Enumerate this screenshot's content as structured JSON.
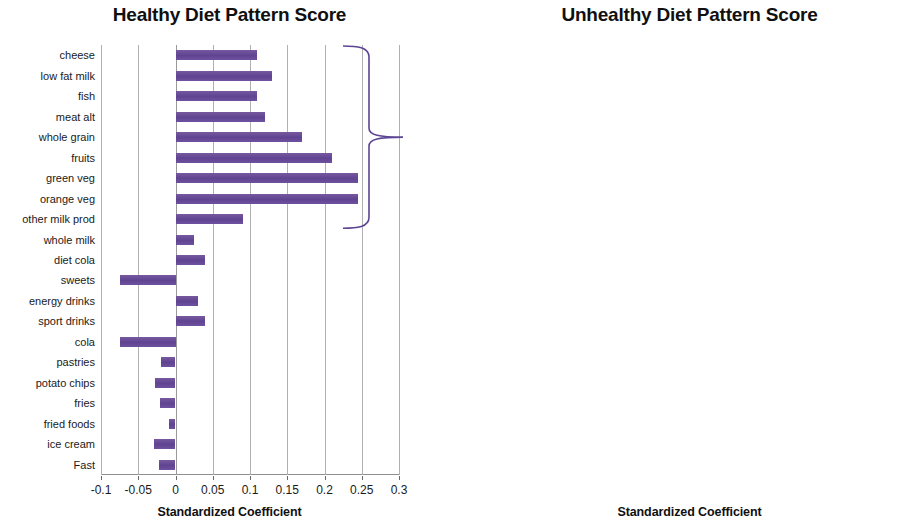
{
  "chart_data": [
    {
      "type": "bar",
      "orientation": "horizontal",
      "title": "Healthy Diet Pattern Score",
      "xlabel": "Standardized Coefficient",
      "ylabel": "",
      "xlim": [
        -0.1,
        0.3
      ],
      "xticks": [
        "-0.1",
        "-0.05",
        "0",
        "0.05",
        "0.1",
        "0.15",
        "0.2",
        "0.25",
        "0.3"
      ],
      "xtick_values": [
        -0.1,
        -0.05,
        0,
        0.05,
        0.1,
        0.15,
        0.2,
        0.25,
        0.3
      ],
      "grid": true,
      "legend": "none",
      "bar_color": "#6a4f9c",
      "categories": [
        "cheese",
        "low fat milk",
        "fish",
        "meat alt",
        "whole grain",
        "fruits",
        "green veg",
        "orange veg",
        "other milk prod",
        "whole milk",
        "diet cola",
        "sweets",
        "energy drinks",
        "sport drinks",
        "cola",
        "pastries",
        "potato chips",
        "fries",
        "fried foods",
        "ice cream",
        "Fast"
      ],
      "values": [
        0.11,
        0.13,
        0.11,
        0.12,
        0.17,
        0.21,
        0.245,
        0.245,
        0.09,
        0.025,
        0.04,
        -0.075,
        0.03,
        0.04,
        -0.075,
        -0.02,
        -0.028,
        -0.021,
        -0.009,
        -0.029,
        -0.022
      ],
      "annotations": [
        {
          "type": "brace",
          "label": "",
          "spans_categories": [
            "cheese",
            "low fat milk",
            "fish",
            "meat alt",
            "whole grain",
            "fruits",
            "green veg",
            "orange veg",
            "other milk prod"
          ]
        }
      ]
    },
    {
      "type": "bar",
      "orientation": "horizontal",
      "title": "Unhealthy Diet Pattern Score",
      "xlabel": "Standardized Coefficient",
      "ylabel": "",
      "xlim": [
        -0.1,
        0.3
      ],
      "xticks": [
        "-0.1",
        "-0.05",
        "0",
        "0.05",
        "0.1",
        "0.15",
        "0.2",
        "0.25",
        "0.3"
      ],
      "xtick_values": [
        -0.1,
        -0.05,
        0,
        0.05,
        0.1,
        0.15,
        0.2,
        0.25,
        0.3
      ],
      "grid": true,
      "legend": "none",
      "bar_color": "#6a4f9c",
      "categories": [
        "cheese",
        "low fat milk",
        "fish",
        "meat alt",
        "whole grain",
        "fruits",
        "green veg",
        "orange veg",
        "other milk prod",
        "whole milk",
        "diet cola",
        "sweets",
        "energy drinks",
        "sport drinks",
        "cola",
        "pastries",
        "potato chips",
        "fries",
        "fried foods",
        "ice cream",
        "Fast"
      ],
      "values": [
        0.041,
        -0.03,
        0.05,
        0.03,
        0.006,
        -0.04,
        -0.069,
        -0.03,
        0.07,
        0.049,
        0.081,
        0.119,
        0.111,
        0.12,
        0.14,
        0.14,
        0.14,
        0.14,
        0.14,
        0.154,
        0.154
      ],
      "annotations": [
        {
          "type": "brace",
          "label": "",
          "spans_categories": [
            "sweets",
            "energy drinks",
            "sport drinks",
            "cola",
            "pastries",
            "potato chips",
            "fries",
            "fried foods",
            "ice cream",
            "Fast"
          ]
        }
      ]
    }
  ]
}
